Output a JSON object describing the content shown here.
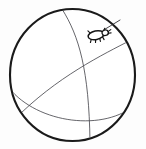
{
  "figure": {
    "kind": "line-drawing",
    "background_color": "#fdfdfd",
    "canvas": {
      "width": 146,
      "height": 149
    },
    "sphere": {
      "label": "sphere-outline",
      "center_x": 72.5,
      "center_y": 75,
      "radius_x": 62.5,
      "radius_y": 66,
      "stroke_color": "#1a1a1a",
      "stroke_width": 2.1,
      "fill_color": "#ffffff"
    },
    "meridians": [
      {
        "label": "meridian-vertical",
        "description": "great-circle arc running from top of sphere down to lower right",
        "stroke_color": "#4a4a50",
        "stroke_width": 0.85,
        "path": "M 62 10 C 78 38, 88 72, 90 140"
      },
      {
        "label": "meridian-diagonal",
        "description": "great-circle arc sweeping from upper right down across to lower left",
        "stroke_color": "#4a4a50",
        "stroke_width": 0.85,
        "path": "M 128 43 C 100 56, 58 76, 17 117"
      },
      {
        "label": "equator-arc",
        "description": "shallow equator arc across the lower third of the sphere",
        "stroke_color": "#4a4a50",
        "stroke_width": 0.85,
        "path": "M 11 90 C 40 123, 104 131, 133 107"
      }
    ],
    "tick": {
      "label": "tick-insect",
      "description": "small tick drawn on the upper right surface of the sphere, facing right",
      "position_x": 97,
      "position_y": 35,
      "stroke_color": "#151515",
      "fill_color": "#ffffff",
      "leg_count": 6,
      "antenna": {
        "label": "antenna-line",
        "path": "M 106 31 L 122 26"
      }
    }
  },
  "accessibility": {
    "alt_text": "Outline drawing of a sphere with meridian lines and a small tick on its upper right surface"
  }
}
